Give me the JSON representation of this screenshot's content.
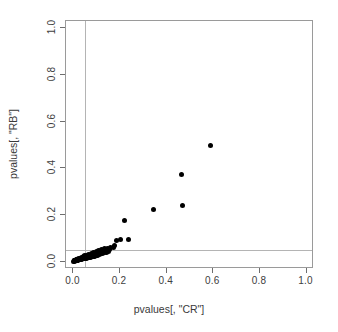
{
  "figure": {
    "width": 338,
    "height": 332,
    "background": "#ffffff"
  },
  "axes": {
    "xlabel": "pvalues[, \"CR\"]",
    "ylabel": "pvalues[, \"RB\"]",
    "xticklabels": [
      "0.0",
      "0.2",
      "0.4",
      "0.6",
      "0.8",
      "1.0"
    ],
    "yticklabels": [
      "0.0",
      "0.2",
      "0.4",
      "0.6",
      "0.8",
      "1.0"
    ],
    "box_color": "#9a9a9a",
    "tick_color": "#6e6e6e",
    "text_color": "#3a3a3a"
  },
  "chart_data": {
    "type": "scatter",
    "title": "",
    "xlabel": "pvalues[, \"CR\"]",
    "ylabel": "pvalues[, \"RB\"]",
    "xlim": [
      0.0,
      1.0
    ],
    "ylim": [
      0.0,
      1.0
    ],
    "xticks": [
      0.0,
      0.2,
      0.4,
      0.6,
      0.8,
      1.0
    ],
    "yticks": [
      0.0,
      0.2,
      0.4,
      0.6,
      0.8,
      1.0
    ],
    "grid": false,
    "legend": null,
    "marker": {
      "shape": "circle",
      "color": "#000000",
      "size_px": 5,
      "filled": true
    },
    "reference_lines": [
      {
        "orientation": "vertical",
        "value": 0.05,
        "color": "#b4b4b4",
        "width_px": 1
      },
      {
        "orientation": "horizontal",
        "value": 0.05,
        "color": "#b4b4b4",
        "width_px": 1
      }
    ],
    "x": [
      0.59,
      0.462,
      0.466,
      0.345,
      0.221,
      0.236,
      0.201,
      0.186,
      0.176,
      0.172,
      0.16,
      0.155,
      0.15,
      0.146,
      0.143,
      0.138,
      0.133,
      0.128,
      0.124,
      0.12,
      0.116,
      0.113,
      0.11,
      0.107,
      0.104,
      0.101,
      0.098,
      0.096,
      0.094,
      0.092,
      0.089,
      0.087,
      0.085,
      0.083,
      0.081,
      0.079,
      0.077,
      0.075,
      0.073,
      0.071,
      0.069,
      0.067,
      0.065,
      0.063,
      0.061,
      0.059,
      0.057,
      0.055,
      0.053,
      0.051,
      0.049,
      0.047,
      0.045,
      0.043,
      0.041,
      0.04,
      0.038,
      0.036,
      0.035,
      0.033,
      0.032,
      0.03,
      0.029,
      0.027,
      0.026,
      0.025,
      0.023,
      0.022,
      0.021,
      0.02,
      0.019,
      0.018,
      0.017,
      0.016,
      0.015,
      0.014,
      0.013,
      0.012,
      0.011,
      0.01,
      0.009,
      0.008,
      0.007,
      0.006,
      0.005,
      0.004,
      0.003,
      0.002,
      0.133,
      0.12,
      0.108,
      0.097,
      0.086,
      0.076,
      0.066,
      0.057,
      0.049,
      0.042,
      0.035,
      0.029,
      0.023,
      0.018,
      0.014,
      0.01,
      0.007,
      0.004
    ],
    "y": [
      0.5,
      0.375,
      0.24,
      0.225,
      0.175,
      0.096,
      0.094,
      0.09,
      0.068,
      0.06,
      0.062,
      0.05,
      0.044,
      0.054,
      0.04,
      0.047,
      0.038,
      0.044,
      0.035,
      0.04,
      0.033,
      0.038,
      0.03,
      0.035,
      0.028,
      0.033,
      0.026,
      0.03,
      0.024,
      0.029,
      0.023,
      0.027,
      0.022,
      0.026,
      0.021,
      0.024,
      0.02,
      0.023,
      0.019,
      0.022,
      0.018,
      0.021,
      0.017,
      0.02,
      0.016,
      0.019,
      0.015,
      0.018,
      0.014,
      0.017,
      0.013,
      0.016,
      0.012,
      0.015,
      0.011,
      0.014,
      0.011,
      0.013,
      0.01,
      0.012,
      0.009,
      0.011,
      0.009,
      0.01,
      0.008,
      0.01,
      0.007,
      0.009,
      0.007,
      0.008,
      0.006,
      0.008,
      0.006,
      0.007,
      0.005,
      0.007,
      0.005,
      0.006,
      0.004,
      0.006,
      0.004,
      0.005,
      0.003,
      0.004,
      0.003,
      0.003,
      0.002,
      0.002,
      0.056,
      0.052,
      0.048,
      0.043,
      0.039,
      0.035,
      0.031,
      0.028,
      0.024,
      0.021,
      0.018,
      0.015,
      0.013,
      0.01,
      0.008,
      0.006,
      0.004,
      0.003
    ]
  }
}
